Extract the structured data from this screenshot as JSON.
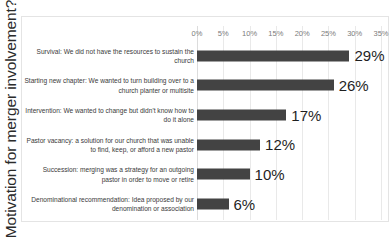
{
  "chart_data": {
    "type": "bar",
    "orientation": "horizontal",
    "title": "",
    "xlabel": "",
    "ylabel": "Motivation for merger involvement?",
    "xlim": [
      0,
      35
    ],
    "grid": true,
    "legend": false,
    "bar_color": "#434343",
    "tick_labels": [
      "0%",
      "5%",
      "10%",
      "15%",
      "20%",
      "25%",
      "30%",
      "35%"
    ],
    "tick_values": [
      0,
      5,
      10,
      15,
      20,
      25,
      30,
      35
    ],
    "categories": [
      "Survival: We did not have the resources to sustain the church",
      "Starting new chapter: We wanted to turn building over to a church planter or multisite",
      "Intervention: We wanted to change but didn't know how to do it alone",
      "Pastor vacancy: a solution for our church that was unable to find, keep, or afford a new pastor",
      "Succession: merging was a strategy for an outgoing pastor in order to move or retire",
      "Denominational recommendation: Idea proposed by our denomination or association"
    ],
    "values": [
      29,
      26,
      17,
      12,
      10,
      6
    ],
    "data_labels": [
      "29%",
      "26%",
      "17%",
      "12%",
      "10%",
      "6%"
    ]
  }
}
